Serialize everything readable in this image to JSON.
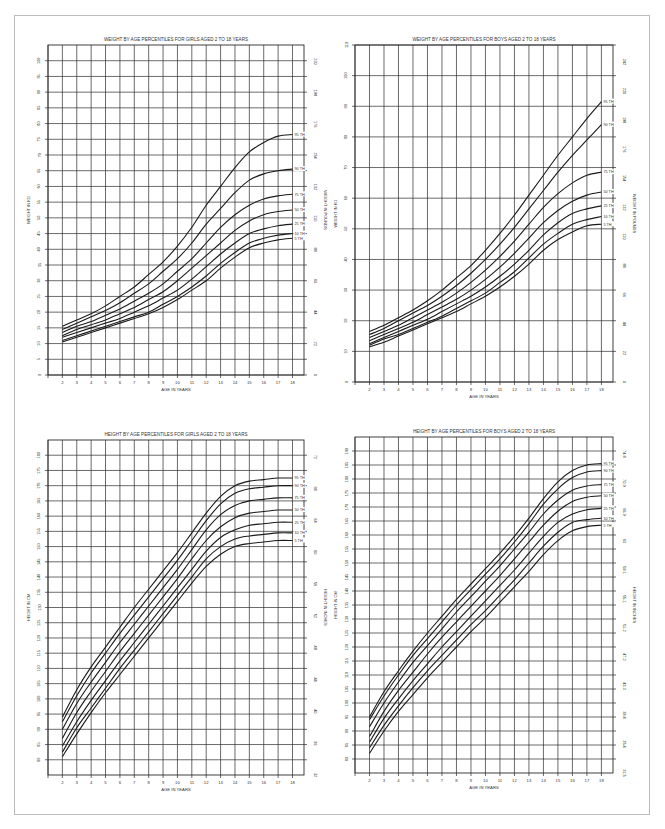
{
  "page": {
    "frame": {
      "border_color": "#bdbdbd",
      "background": "#ffffff"
    },
    "line_color": "#1a1a1a",
    "grid_color": "#2b2b2b"
  },
  "chart_data": [
    {
      "id": "girls-weight",
      "type": "line",
      "title": "WEIGHT BY AGE PERCENTILES FOR GIRLS AGED 2 TO 18 YEARS",
      "xlabel": "AGE IN YEARS",
      "ylabel": "WEIGHT IN KG",
      "ylabel_right": "WEIGHT IN POUNDS",
      "x": [
        2,
        3,
        4,
        5,
        6,
        7,
        8,
        9,
        10,
        11,
        12,
        13,
        14,
        15,
        16,
        17,
        18
      ],
      "xlim": [
        1,
        18.8
      ],
      "ylim": [
        0,
        105
      ],
      "yticks": [
        0,
        5,
        10,
        15,
        20,
        25,
        30,
        35,
        40,
        45,
        50,
        55,
        60,
        65,
        70,
        75,
        80,
        85,
        90,
        95,
        100
      ],
      "yticks_right": [
        0,
        22,
        44,
        66,
        88,
        110,
        132,
        154,
        176,
        198,
        220
      ],
      "grid": true,
      "box": {
        "left": 48,
        "top": 45,
        "width": 256,
        "height": 330
      },
      "series": [
        {
          "name": "95 TH",
          "values": [
            15.5,
            17.5,
            19.5,
            22,
            25,
            28,
            32,
            36,
            41,
            47,
            54,
            60,
            66,
            71,
            74,
            76,
            76.5
          ]
        },
        {
          "name": "90 TH",
          "values": [
            14.5,
            16.5,
            18.5,
            20.5,
            23,
            26,
            29,
            33,
            37,
            42,
            48,
            53,
            58,
            62,
            64,
            65,
            65.5
          ]
        },
        {
          "name": "75 TH",
          "values": [
            13.5,
            15.5,
            17,
            19,
            21,
            23.5,
            26,
            29,
            33,
            37,
            42,
            47,
            51,
            54,
            56,
            57,
            57.5
          ]
        },
        {
          "name": "50 TH",
          "values": [
            12.5,
            14.5,
            16,
            17.5,
            19.5,
            21.5,
            24,
            26.5,
            30,
            34,
            38,
            42,
            46,
            49,
            51,
            52,
            52.5
          ]
        },
        {
          "name": "25 TH",
          "values": [
            12,
            13.5,
            15,
            16.5,
            18,
            20,
            22,
            24.5,
            27,
            30.5,
            34.5,
            38.5,
            42,
            45,
            46.5,
            47.5,
            48
          ]
        },
        {
          "name": "10 TH",
          "values": [
            11,
            12.5,
            14,
            15.5,
            17,
            18.5,
            20,
            22.5,
            25,
            28,
            31.5,
            35.5,
            39,
            42,
            43.5,
            44.5,
            45
          ]
        },
        {
          "name": "5 TH",
          "values": [
            10.5,
            12,
            13.5,
            15,
            16.5,
            18,
            19.5,
            21.5,
            24,
            27,
            30,
            34,
            37.5,
            40.5,
            42,
            43,
            43.5
          ]
        }
      ]
    },
    {
      "id": "boys-weight",
      "type": "line",
      "title": "WEIGHT BY AGE PERCENTILES FOR BOYS AGED 2 TO 18 YEARS",
      "xlabel": "AGE IN YEARS",
      "ylabel": "WEIGHT IN KG",
      "ylabel_right": "WEIGHT IN POUNDS",
      "x": [
        2,
        3,
        4,
        5,
        6,
        7,
        8,
        9,
        10,
        11,
        12,
        13,
        14,
        15,
        16,
        17,
        18
      ],
      "xlim": [
        1,
        18.8
      ],
      "ylim": [
        0,
        110
      ],
      "yticks": [
        0,
        10,
        20,
        30,
        40,
        50,
        60,
        70,
        80,
        90,
        100,
        110
      ],
      "yticks_right": [
        0,
        22,
        44,
        66,
        88,
        110,
        132,
        154,
        176,
        198,
        220,
        242
      ],
      "grid": true,
      "box": {
        "left": 355,
        "top": 45,
        "width": 258,
        "height": 337
      },
      "series": [
        {
          "name": "95 TH",
          "values": [
            16.5,
            18.5,
            21,
            23.5,
            26.5,
            30,
            34,
            38,
            43,
            48.5,
            54.5,
            61,
            67.5,
            74,
            80,
            86,
            91.5
          ]
        },
        {
          "name": "90 TH",
          "values": [
            15.5,
            17.5,
            20,
            22.5,
            25,
            28,
            31.5,
            35.5,
            40,
            45,
            50.5,
            56.5,
            62.5,
            68.5,
            74,
            79,
            84
          ]
        },
        {
          "name": "75 TH",
          "values": [
            14.5,
            16.5,
            18.5,
            21,
            23.5,
            26,
            29,
            32.5,
            36.5,
            41,
            46,
            51.5,
            57,
            61.5,
            65,
            67.5,
            68.5
          ]
        },
        {
          "name": "50 TH",
          "values": [
            13.5,
            15.5,
            17.5,
            19.5,
            22,
            24.5,
            27,
            30,
            33.5,
            37.5,
            42,
            47,
            52,
            56,
            59,
            61,
            62
          ]
        },
        {
          "name": "25 TH",
          "values": [
            12.5,
            14.5,
            16.5,
            18.5,
            20.5,
            23,
            25.5,
            28,
            31,
            34.5,
            38.5,
            43,
            48,
            52,
            55,
            56.5,
            57.5
          ]
        },
        {
          "name": "10 TH",
          "values": [
            12,
            14,
            15.5,
            17.5,
            19.5,
            21.5,
            24,
            26.5,
            29,
            32.5,
            36,
            40.5,
            45,
            48.5,
            51.5,
            53,
            54
          ]
        },
        {
          "name": "5 TH",
          "values": [
            11.5,
            13,
            15,
            17,
            19,
            21,
            23,
            25.5,
            28,
            31,
            34.5,
            38.5,
            43,
            46.5,
            49,
            51,
            51.5
          ]
        }
      ]
    },
    {
      "id": "girls-height",
      "type": "line",
      "title": "HEIGHT BY AGE PERCENTILES FOR GIRLS AGED 2 TO 18 YEARS",
      "xlabel": "AGE IN YEARS",
      "ylabel": "HEIGHT IN CM",
      "ylabel_right": "HEIGHT IN INCHES",
      "x": [
        2,
        3,
        4,
        5,
        6,
        7,
        8,
        9,
        10,
        11,
        12,
        13,
        14,
        15,
        16,
        17,
        18
      ],
      "xlim": [
        1,
        18.8
      ],
      "ylim": [
        75,
        185
      ],
      "yticks": [
        80,
        85,
        90,
        95,
        100,
        105,
        110,
        115,
        120,
        125,
        130,
        135,
        140,
        145,
        150,
        155,
        160,
        165,
        170,
        175,
        180
      ],
      "yticks_right": [
        32,
        36,
        40,
        44,
        48,
        52,
        56,
        60,
        64,
        68,
        72
      ],
      "grid": true,
      "box": {
        "left": 48,
        "top": 440,
        "width": 256,
        "height": 335
      },
      "series": [
        {
          "name": "95 TH",
          "values": [
            94,
            103,
            110.5,
            117,
            123.5,
            130,
            136,
            142,
            148,
            154.5,
            161,
            166.5,
            170,
            171.5,
            172,
            172.5,
            172.5
          ]
        },
        {
          "name": "90 TH",
          "values": [
            92.5,
            101,
            108.5,
            115,
            121.5,
            127.5,
            133.5,
            139.5,
            145.5,
            152,
            158.5,
            164,
            167.5,
            169,
            169.5,
            170,
            170
          ]
        },
        {
          "name": "75 TH",
          "values": [
            90,
            98.5,
            105.5,
            112,
            118.5,
            124.5,
            130.5,
            136.5,
            142.5,
            149,
            155.5,
            160.5,
            163.5,
            165,
            165.5,
            166,
            166
          ]
        },
        {
          "name": "50 TH",
          "values": [
            87,
            95.5,
            102.5,
            109,
            115.5,
            121.5,
            127.5,
            133.5,
            139.5,
            146,
            152,
            156.5,
            159.5,
            161,
            161.5,
            162,
            162
          ]
        },
        {
          "name": "25 TH",
          "values": [
            84.5,
            92.5,
            99.5,
            106,
            112.5,
            118.5,
            124.5,
            130.5,
            136.5,
            142.5,
            148.5,
            153,
            155.5,
            157,
            157.5,
            158,
            158
          ]
        },
        {
          "name": "10 TH",
          "values": [
            82.5,
            90.5,
            97,
            103.5,
            110,
            116,
            122,
            128,
            134,
            140,
            146,
            150,
            152.5,
            153.5,
            154,
            154.5,
            154.5
          ]
        },
        {
          "name": "5 TH",
          "values": [
            81,
            88.5,
            95.5,
            102,
            108,
            114,
            120,
            126,
            132,
            138,
            143.5,
            147.5,
            150,
            151,
            151.5,
            152,
            152
          ]
        }
      ]
    },
    {
      "id": "boys-height",
      "type": "line",
      "title": "HEIGHT BY AGE PERCENTILES FOR BOYS AGED 2 TO 18 YEARS",
      "xlabel": "AGE IN YEARS",
      "ylabel": "HEIGHT IN CM",
      "ylabel_right": "HEIGHT IN INCHES",
      "x": [
        2,
        3,
        4,
        5,
        6,
        7,
        8,
        9,
        10,
        11,
        12,
        13,
        14,
        15,
        16,
        17,
        18
      ],
      "xlim": [
        1,
        18.8
      ],
      "ylim": [
        75,
        195
      ],
      "yticks": [
        80,
        85,
        90,
        95,
        100,
        105,
        110,
        115,
        120,
        125,
        130,
        135,
        140,
        145,
        150,
        155,
        160,
        165,
        170,
        175,
        180,
        185,
        190
      ],
      "yticks_right": [
        31.5,
        35.4,
        39.4,
        43.3,
        47.2,
        51.2,
        55.1,
        59.1,
        63.0,
        66.9,
        70.9,
        74.8
      ],
      "grid": true,
      "box": {
        "left": 355,
        "top": 437,
        "width": 258,
        "height": 336
      },
      "series": [
        {
          "name": "95 TH",
          "values": [
            95,
            104,
            111.5,
            118.5,
            125,
            131,
            137,
            142.5,
            148,
            153.5,
            159.5,
            166,
            173,
            179,
            183,
            185,
            185.5
          ]
        },
        {
          "name": "90 TH",
          "values": [
            94,
            102.5,
            110,
            117,
            123,
            129,
            135,
            140.5,
            146,
            151.5,
            157.5,
            164,
            171,
            176.5,
            180.5,
            182.5,
            183
          ]
        },
        {
          "name": "75 TH",
          "values": [
            91.5,
            100,
            107.5,
            114.5,
            120.5,
            126.5,
            132.5,
            138,
            143.5,
            149,
            155,
            161,
            167.5,
            172.5,
            176,
            177.5,
            178
          ]
        },
        {
          "name": "50 TH",
          "values": [
            88,
            97,
            104.5,
            111,
            117.5,
            123.5,
            129,
            134.5,
            140,
            145.5,
            151.5,
            157.5,
            163.5,
            168.5,
            172,
            173.5,
            174
          ]
        },
        {
          "name": "25 TH",
          "values": [
            86,
            94.5,
            101.5,
            108,
            114,
            120,
            125.5,
            131,
            136.5,
            142,
            147.5,
            153.5,
            159.5,
            164.5,
            167.5,
            169,
            169.5
          ]
        },
        {
          "name": "10 TH",
          "values": [
            84,
            92,
            99,
            105.5,
            111.5,
            117,
            122.5,
            128,
            133,
            138.5,
            144,
            150,
            156,
            161,
            164.5,
            165.5,
            166
          ]
        },
        {
          "name": "5 TH",
          "values": [
            82,
            90,
            97,
            103,
            109,
            114.5,
            120,
            125.5,
            130.5,
            136,
            141.5,
            147,
            153,
            158,
            161.5,
            163,
            163.5
          ]
        }
      ]
    }
  ]
}
